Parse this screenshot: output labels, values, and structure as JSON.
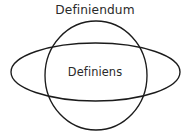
{
  "diagram": {
    "type": "venn-euler-diagram",
    "background_color": "#ffffff",
    "stroke_color": "#1b1b1b",
    "text_color": "#2a2a2a",
    "outer_label": "Definiendum",
    "inner_label": "Definiens",
    "shapes": [
      {
        "name": "definiendum-circle",
        "kind": "circle",
        "cx": 96,
        "cy": 75.5,
        "rx": 51,
        "ry": 54.5
      },
      {
        "name": "definiens-ellipse",
        "kind": "ellipse",
        "cx": 95.5,
        "cy": 72,
        "rx": 84.5,
        "ry": 29
      }
    ]
  }
}
